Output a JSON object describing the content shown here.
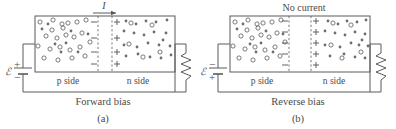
{
  "figure": {
    "title_alt": "pn junction under forward and reverse bias",
    "colors": {
      "line": "#5a5a5a",
      "electron_fill": "#6e6e6e",
      "hole_stroke": "#5a5a5a",
      "text": "#4a4a4a",
      "background": "#ffffff"
    }
  },
  "panels": [
    {
      "id": "a",
      "caption": "Forward bias",
      "subcaption": "(a)",
      "top_label": "I",
      "top_label_kind": "current-arrow",
      "arrow_direction": "right",
      "emf_symbol": "ℰ",
      "battery_top_terminal": "+",
      "battery_bottom_terminal": "−",
      "p_side_label": "p side",
      "n_side_label": "n side",
      "depletion_left_signs": [
        "−",
        "−",
        "−",
        "−"
      ],
      "depletion_right_signs": [
        "+",
        "+",
        "+",
        "+"
      ],
      "depletion_zone_width_px": 14,
      "resistor": "zigzag-resistor"
    },
    {
      "id": "b",
      "caption": "Reverse bias",
      "subcaption": "(b)",
      "top_label": "No current",
      "top_label_kind": "text",
      "arrow_direction": "none",
      "emf_symbol": "ℰ",
      "battery_top_terminal": "−",
      "battery_bottom_terminal": "+",
      "p_side_label": "p side",
      "n_side_label": "n side",
      "depletion_left_signs": [
        "−",
        "−",
        "−",
        "−",
        "−"
      ],
      "depletion_right_signs": [
        "+",
        "+",
        "+",
        "+",
        "+"
      ],
      "depletion_zone_width_px": 22,
      "resistor": "zigzag-resistor"
    }
  ],
  "legend_semantics": {
    "open_circle": "hole (positive charge carrier)",
    "filled_dot": "electron (negative charge carrier)"
  },
  "carriers": {
    "panel_a": {
      "p_side_holes": [
        [
          40,
          22
        ],
        [
          53,
          20
        ],
        [
          62,
          24
        ],
        [
          68,
          23
        ],
        [
          77,
          22
        ],
        [
          86,
          20
        ],
        [
          46,
          36
        ],
        [
          57,
          38
        ],
        [
          66,
          35
        ],
        [
          74,
          37
        ],
        [
          82,
          33
        ],
        [
          38,
          46
        ],
        [
          50,
          49
        ],
        [
          60,
          47
        ],
        [
          70,
          50
        ],
        [
          80,
          47
        ],
        [
          44,
          58
        ],
        [
          58,
          60
        ],
        [
          72,
          58
        ],
        [
          85,
          56
        ],
        [
          63,
          28
        ],
        [
          52,
          30
        ],
        [
          90,
          42
        ],
        [
          34,
          33
        ],
        [
          42,
          29
        ]
      ],
      "p_side_electrons": [
        [
          48,
          24
        ],
        [
          71,
          31
        ],
        [
          55,
          44
        ],
        [
          66,
          43
        ],
        [
          78,
          52
        ],
        [
          88,
          34
        ],
        [
          36,
          53
        ],
        [
          61,
          52
        ],
        [
          84,
          46
        ]
      ],
      "n_side_holes": [
        [
          121,
          23
        ],
        [
          140,
          21
        ],
        [
          158,
          23
        ],
        [
          125,
          44
        ],
        [
          147,
          47
        ],
        [
          134,
          57
        ],
        [
          160,
          52
        ],
        [
          116,
          36
        ]
      ],
      "n_side_electrons": [
        [
          118,
          21
        ],
        [
          128,
          24
        ],
        [
          136,
          21
        ],
        [
          150,
          22
        ],
        [
          164,
          20
        ],
        [
          112,
          31
        ],
        [
          122,
          33
        ],
        [
          132,
          35
        ],
        [
          143,
          32
        ],
        [
          155,
          34
        ],
        [
          167,
          33
        ],
        [
          115,
          45
        ],
        [
          130,
          47
        ],
        [
          141,
          43
        ],
        [
          152,
          45
        ],
        [
          163,
          46
        ],
        [
          119,
          56
        ],
        [
          133,
          54
        ],
        [
          145,
          57
        ],
        [
          156,
          58
        ],
        [
          168,
          55
        ],
        [
          126,
          28
        ],
        [
          160,
          40
        ],
        [
          138,
          50
        ]
      ]
    },
    "panel_b": {
      "p_side_holes": [
        [
          235,
          22
        ],
        [
          248,
          20
        ],
        [
          257,
          24
        ],
        [
          263,
          23
        ],
        [
          272,
          22
        ],
        [
          281,
          20
        ],
        [
          241,
          36
        ],
        [
          252,
          38
        ],
        [
          261,
          35
        ],
        [
          269,
          37
        ],
        [
          277,
          33
        ],
        [
          233,
          46
        ],
        [
          245,
          49
        ],
        [
          255,
          47
        ],
        [
          265,
          50
        ],
        [
          275,
          47
        ],
        [
          239,
          58
        ],
        [
          253,
          60
        ],
        [
          267,
          58
        ],
        [
          280,
          56
        ],
        [
          258,
          28
        ],
        [
          247,
          30
        ],
        [
          285,
          42
        ],
        [
          229,
          33
        ]
      ],
      "p_side_electrons": [
        [
          243,
          24
        ],
        [
          266,
          31
        ],
        [
          250,
          44
        ],
        [
          261,
          43
        ],
        [
          273,
          52
        ],
        [
          283,
          34
        ],
        [
          231,
          53
        ],
        [
          256,
          52
        ]
      ],
      "n_side_holes": [
        [
          330,
          23
        ],
        [
          348,
          21
        ],
        [
          360,
          26
        ],
        [
          334,
          45
        ],
        [
          352,
          48
        ],
        [
          342,
          58
        ],
        [
          362,
          53
        ],
        [
          326,
          36
        ]
      ],
      "n_side_electrons": [
        [
          328,
          21
        ],
        [
          338,
          24
        ],
        [
          346,
          21
        ],
        [
          356,
          22
        ],
        [
          366,
          20
        ],
        [
          324,
          31
        ],
        [
          334,
          33
        ],
        [
          344,
          35
        ],
        [
          354,
          32
        ],
        [
          364,
          34
        ],
        [
          322,
          45
        ],
        [
          340,
          47
        ],
        [
          350,
          43
        ],
        [
          358,
          45
        ],
        [
          368,
          46
        ],
        [
          330,
          56
        ],
        [
          344,
          54
        ],
        [
          354,
          57
        ],
        [
          364,
          58
        ],
        [
          336,
          28
        ],
        [
          362,
          40
        ],
        [
          348,
          50
        ]
      ]
    }
  }
}
